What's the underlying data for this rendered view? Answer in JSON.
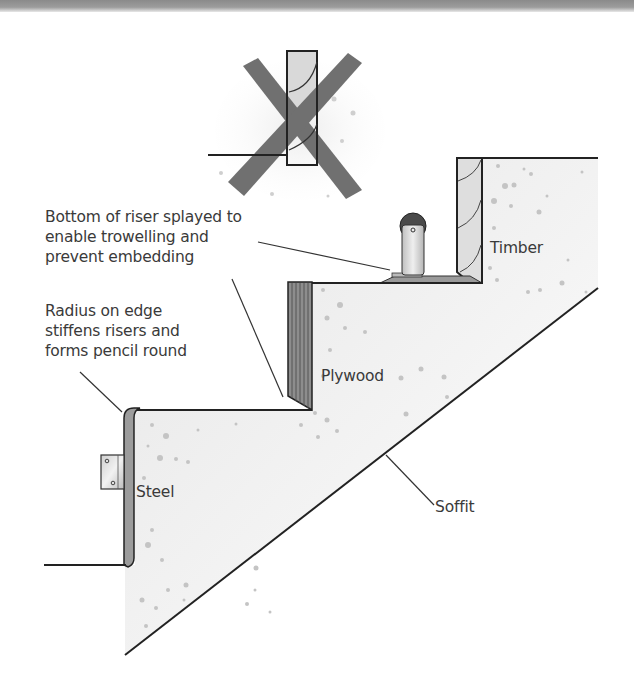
{
  "diagram": {
    "colors": {
      "ink": "#2a2a2a",
      "cross_mark": "#6f6f6f",
      "concrete_fill": "#f0f0f0",
      "speckle": "#bdbdbd",
      "plywood": "#8c8c8c",
      "steel": "#9a9a9a",
      "timber": "#dcdcdc"
    },
    "wrong_example": {
      "mark": "cross-out-x",
      "description": "Incorrect riser detail (crossed out)"
    },
    "annotations": [
      {
        "id": "splayed",
        "lines": [
          "Bottom of riser splayed to",
          "enable trowelling and",
          "prevent embedding"
        ]
      },
      {
        "id": "radius",
        "lines": [
          "Radius on edge",
          "stiffens risers and",
          "forms pencil round"
        ]
      }
    ],
    "labels": {
      "timber": "Timber",
      "plywood": "Plywood",
      "steel": "Steel",
      "soffit": "Soffit"
    }
  }
}
